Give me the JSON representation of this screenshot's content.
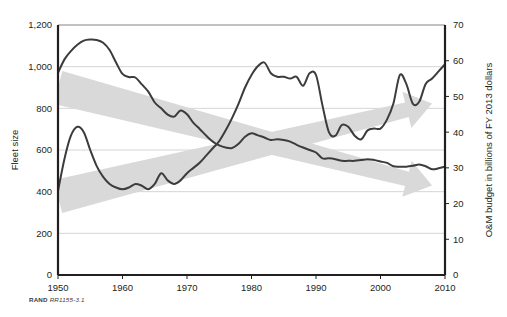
{
  "figure": {
    "source_note_brand": "RAND",
    "source_note_tag": "RR1155-3.1"
  },
  "chart_data": {
    "type": "line",
    "title": "",
    "xlabel": "",
    "grid": true,
    "legend": "none",
    "x": [
      1950,
      1951,
      1952,
      1953,
      1954,
      1955,
      1956,
      1957,
      1958,
      1959,
      1960,
      1961,
      1962,
      1963,
      1964,
      1965,
      1966,
      1967,
      1968,
      1969,
      1970,
      1971,
      1972,
      1973,
      1974,
      1975,
      1976,
      1977,
      1978,
      1979,
      1980,
      1981,
      1982,
      1983,
      1984,
      1985,
      1986,
      1987,
      1988,
      1989,
      1990,
      1991,
      1992,
      1993,
      1994,
      1995,
      1996,
      1997,
      1998,
      1999,
      2000,
      2001,
      2002,
      2003,
      2004,
      2005,
      2006,
      2007,
      2008,
      2009,
      2010
    ],
    "xlim": [
      1950,
      2010
    ],
    "xticks": [
      1950,
      1960,
      1970,
      1980,
      1990,
      2000,
      2010
    ],
    "xtick_labels": [
      "1950",
      "1960",
      "1970",
      "1980",
      "1990",
      "2000",
      "2010"
    ],
    "axes": {
      "left": {
        "label": "Fleet size",
        "ylim": [
          0,
          1200
        ],
        "ticks": [
          0,
          200,
          400,
          600,
          800,
          1000,
          1200
        ],
        "tick_labels": [
          "0",
          "200",
          "400",
          "600",
          "800",
          "1,000",
          "1,200"
        ]
      },
      "right": {
        "label": "O&M budget in billions of FY 2013 dollars",
        "ylim": [
          0,
          70
        ],
        "ticks": [
          0,
          10,
          20,
          30,
          40,
          50,
          60,
          70
        ],
        "tick_labels": [
          "0",
          "10",
          "20",
          "30",
          "40",
          "50",
          "60",
          "70"
        ]
      }
    },
    "series": [
      {
        "name": "Fleet size",
        "axis": "left",
        "color": "#3c3c3c",
        "values": [
          970,
          1035,
          1075,
          1105,
          1125,
          1130,
          1128,
          1115,
          1080,
          1020,
          965,
          950,
          948,
          915,
          880,
          828,
          800,
          770,
          760,
          790,
          772,
          730,
          700,
          668,
          640,
          622,
          612,
          610,
          630,
          664,
          680,
          670,
          660,
          648,
          652,
          648,
          640,
          625,
          612,
          600,
          588,
          560,
          560,
          556,
          548,
          548,
          548,
          552,
          556,
          552,
          545,
          538,
          522,
          520,
          520,
          524,
          530,
          522,
          508,
          512,
          520
        ]
      },
      {
        "name": "O&M budget",
        "axis": "right",
        "color": "#3c3c3c",
        "values": [
          23.5,
          32.5,
          39.0,
          41.5,
          40.0,
          35.0,
          30.5,
          27.5,
          25.5,
          24.5,
          24.0,
          24.5,
          25.5,
          25.0,
          24.0,
          25.5,
          28.5,
          26.5,
          25.5,
          26.5,
          28.5,
          30.0,
          31.5,
          33.5,
          35.5,
          37.5,
          40.5,
          44.0,
          48.0,
          52.5,
          56.0,
          58.5,
          59.5,
          56.5,
          55.5,
          55.5,
          55.0,
          55.5,
          53.0,
          56.5,
          56.0,
          47.5,
          40.0,
          39.0,
          42.0,
          41.5,
          39.0,
          38.0,
          40.5,
          41.0,
          41.0,
          43.5,
          48.0,
          56.0,
          53.5,
          48.0,
          48.5,
          53.5,
          55.0,
          57.0,
          59.0
        ]
      }
    ],
    "annotations": [
      {
        "name": "declining-trend-arrow",
        "shape": "tapered-arrow-band",
        "direction": "down-right",
        "color": "#d9d9d9",
        "start": {
          "x": 1950,
          "left_value": 900
        },
        "end": {
          "x": 2008,
          "left_value": 430
        }
      },
      {
        "name": "rising-trend-arrow",
        "shape": "tapered-arrow-band",
        "direction": "up-right",
        "color": "#d9d9d9",
        "start": {
          "x": 1950,
          "right_value": 22
        },
        "end": {
          "x": 2008,
          "right_value": 48
        }
      }
    ]
  }
}
